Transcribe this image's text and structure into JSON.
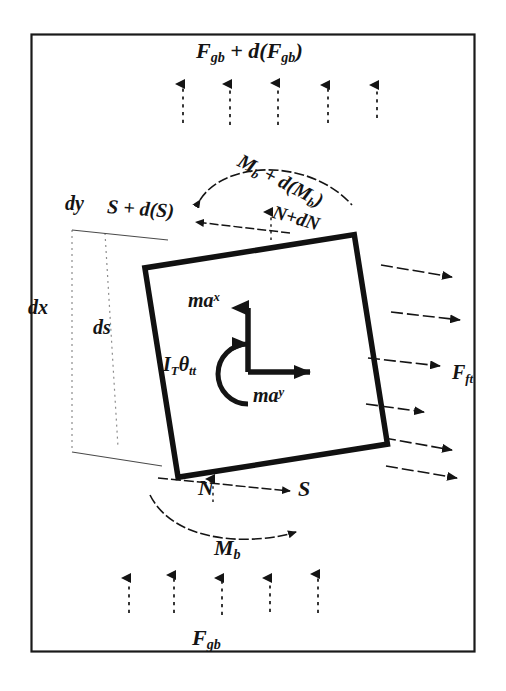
{
  "figure": {
    "type": "free-body-diagram",
    "frame": {
      "stroke": "#1a1a1a",
      "fill": "#ffffff"
    },
    "ink_color": "#141414",
    "element": {
      "shape": "square",
      "rotation_deg": -9,
      "stroke": "#111111",
      "stroke_width": 5
    }
  },
  "labels": {
    "top_body_force": "F",
    "top_body_force_sub": "gb",
    "top_body_force_full": "F_gb + d(F_gb)",
    "top_moment_full": "M_b + d(M_b)",
    "shear_top_full": "S + d(S)",
    "normal_top_full": "N+dN",
    "side_dy": "dy",
    "side_dx": "dx",
    "side_ds": "ds",
    "inertia_x": "ma",
    "inertia_x_sup": "x",
    "inertia_y": "ma",
    "inertia_y_sup": "y",
    "rotational_inertia": "I",
    "rotational_inertia_sub": "T",
    "rotational_inertia_theta": "θ",
    "rotational_inertia_theta_sub": "tt",
    "bottom_normal": "N",
    "bottom_shear": "S",
    "bottom_moment": "M",
    "bottom_moment_sub": "b",
    "bottom_body_force": "F",
    "bottom_body_force_sub": "gb",
    "right_traction": "F",
    "right_traction_sub": "ft"
  },
  "arrows": {
    "top_body_force_count": 5,
    "top_body_force_direction": "up",
    "top_body_force_style": "dashed",
    "bottom_body_force_count": 5,
    "bottom_body_force_direction": "down",
    "bottom_body_force_style": "dashed",
    "right_traction_count": 6,
    "right_traction_direction": "right",
    "right_traction_style": "dashed"
  }
}
